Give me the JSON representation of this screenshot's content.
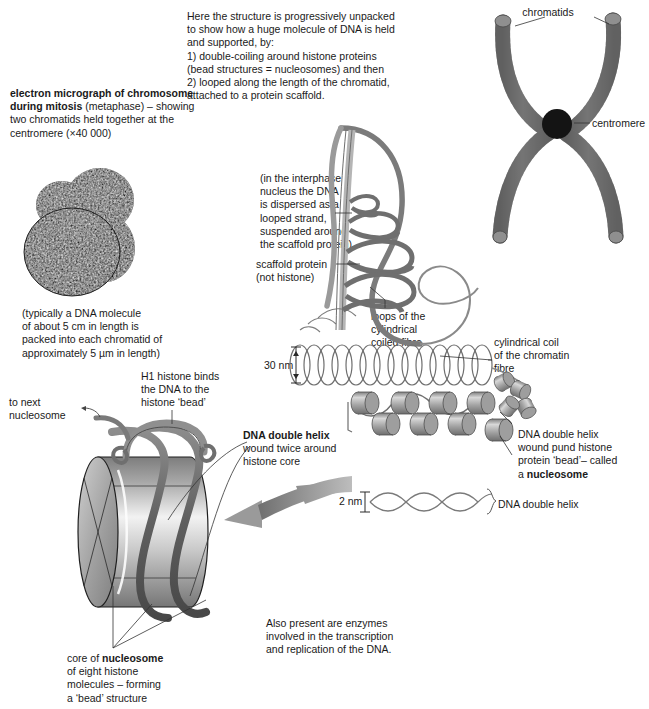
{
  "figure": {
    "colors": {
      "ink": "#1a1a1a",
      "leader_line": "#333333",
      "chromatid_gray": "#8a8a8a",
      "chromatid_dark": "#6e6e6e",
      "centromere": "#141414",
      "cylinder_light": "#e8e8e8",
      "cylinder_mid": "#b0b0b0",
      "cylinder_dark": "#7a7a7a",
      "dna_strand": "#6b6b6b",
      "arrow_gray": "#9a9a9a",
      "coil_line": "#6f6f6f"
    }
  },
  "annotations": {
    "intro": "Here the structure is progressively unpacked\nto show how a huge molecule of DNA is held\nand supported, by:\n1) double-coiling around histone proteins\n(bead structures = nucleosomes) and then\n2) looped along the length of the chromatid,\nattached to a protein scaffold.",
    "micrograph_caption_bold": "electron micrograph of chromosome\nduring mitosis",
    "micrograph_caption_rest": " (metaphase) – showing\ntwo chromatids held together at the\ncentromere (×40 000)",
    "dna_length_note": "(typically a DNA molecule\nof about 5 cm in length is\npacked into each chromatid of\napproximately 5 µm in length)",
    "interphase_note": "(in the interphase\nnucleus the DNA\nis dispersed as a\nlooped strand,\nsuspended around\nthe scaffold protein)",
    "scaffold_protein": "scaffold protein\n(not histone)",
    "loops_label": "loops of the\ncylindrical\ncoiled fibre",
    "cylindrical_coil_label": "cylindrical coil\nof the chromatin\nfibre",
    "scale_30nm": "30 nm",
    "scale_2nm": "2 nm",
    "h1_histone": "H1 histone binds\nthe DNA to the\nhistone ‘bead’",
    "to_next_nucleosome": "to next\nnucleosome",
    "dna_double_helix_bold": "DNA double helix",
    "dna_double_helix_rest": "wound twice around\nhistone core",
    "nucleosome_right_pre": "DNA double helix\nwound pund histone\nprotein ‘bead’– called\na ",
    "nucleosome_right_bold": "nucleosome",
    "dna_double_helix_right": "DNA double helix",
    "core_nucleosome_pre": "core of ",
    "core_nucleosome_bold": "nucleosome",
    "core_nucleosome_rest": "\nof eight histone\nmolecules – forming\na ‘bead’ structure",
    "enzymes_note": "Also present are enzymes\ninvolved in the transcription\nand replication of the DNA.",
    "chromatids": "chromatids",
    "centromere": "centromere"
  }
}
